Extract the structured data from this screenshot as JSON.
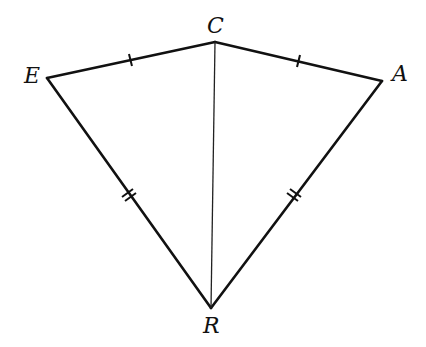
{
  "diagram": {
    "type": "kite",
    "stroke_color": "#111111",
    "points": {
      "E": {
        "label": "E",
        "x": 47,
        "y": 78
      },
      "C": {
        "label": "C",
        "x": 215,
        "y": 42
      },
      "A": {
        "label": "A",
        "x": 382,
        "y": 81
      },
      "R": {
        "label": "R",
        "x": 211,
        "y": 308
      }
    },
    "segments": [
      {
        "from": "E",
        "to": "C",
        "ticks": 1
      },
      {
        "from": "C",
        "to": "A",
        "ticks": 1
      },
      {
        "from": "E",
        "to": "R",
        "ticks": 2
      },
      {
        "from": "A",
        "to": "R",
        "ticks": 2
      },
      {
        "from": "C",
        "to": "R",
        "ticks": 0,
        "style": "thin"
      }
    ]
  }
}
